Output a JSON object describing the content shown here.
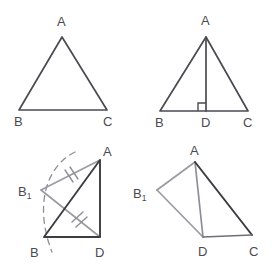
{
  "figure": {
    "background_color": "#ffffff",
    "width": 272,
    "height": 267,
    "colors": {
      "primary_stroke": "#4a4a52",
      "dark_stroke": "#3c3c44",
      "construction_stroke": "#9a9aa2",
      "label_color": "#4a4a52"
    },
    "panels": [
      {
        "id": "panel-top-left",
        "name": "isosceles-triangle-abc",
        "labels": {
          "apex": "A",
          "bottom_left": "B",
          "bottom_right": "C"
        },
        "points": {
          "A": [
            62,
            37
          ],
          "B": [
            19,
            110
          ],
          "C": [
            107,
            110
          ]
        },
        "label_positions": {
          "A": [
            57,
            26
          ],
          "B": [
            14,
            126
          ],
          "C": [
            103,
            126
          ]
        }
      },
      {
        "id": "panel-top-right",
        "name": "triangle-abc-with-altitude-ad",
        "labels": {
          "apex": "A",
          "bottom_left": "B",
          "foot": "D",
          "bottom_right": "C"
        },
        "points": {
          "A": [
            206,
            37
          ],
          "B": [
            160,
            111
          ],
          "D": [
            206,
            111
          ],
          "C": [
            248,
            111
          ]
        },
        "label_positions": {
          "A": [
            201,
            25
          ],
          "B": [
            155,
            127
          ],
          "D": [
            201,
            127
          ],
          "C": [
            243,
            127
          ]
        },
        "right_angle_marker": {
          "at": "D",
          "size": 8,
          "opens": "left"
        }
      },
      {
        "id": "panel-bottom-left",
        "name": "construction-with-arc-and-tick-marks",
        "labels": {
          "apex": "A",
          "reflected": "B₁",
          "bottom_left": "B",
          "bottom_right": "D"
        },
        "points": {
          "A": [
            100,
            160
          ],
          "B1": [
            41,
            190
          ],
          "B": [
            44,
            237
          ],
          "D": [
            100,
            237
          ]
        },
        "label_positions": {
          "A": [
            103,
            156
          ],
          "B1": [
            18,
            192
          ],
          "B": [
            30,
            257
          ],
          "D": [
            95,
            257
          ]
        },
        "tick_marks": [
          {
            "on": "B1-A",
            "count": 2
          },
          {
            "on": "B1-D",
            "count": 2
          }
        ],
        "arc": {
          "name": "compass-arc",
          "dashed": true,
          "from": [
            75,
            152
          ],
          "to": [
            52,
            252
          ]
        }
      },
      {
        "id": "panel-bottom-right",
        "name": "quadrilateral-b1-a-c-d",
        "labels": {
          "apex": "A",
          "reflected": "B₁",
          "foot": "D",
          "bottom_right": "C"
        },
        "points": {
          "A": [
            195,
            162
          ],
          "B1": [
            157,
            190
          ],
          "D": [
            203,
            237
          ],
          "C": [
            252,
            235
          ]
        },
        "label_positions": {
          "A": [
            190,
            155
          ],
          "B1": [
            133,
            194
          ],
          "D": [
            198,
            256
          ],
          "C": [
            249,
            256
          ]
        }
      }
    ]
  }
}
